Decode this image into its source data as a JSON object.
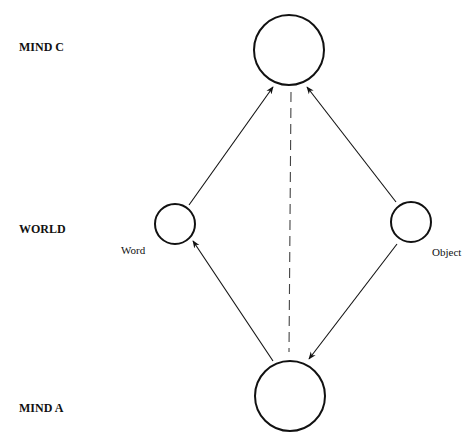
{
  "diagram": {
    "row_labels": {
      "mind_c": "MIND C",
      "world": "WORLD",
      "mind_a": "MIND A"
    },
    "node_labels": {
      "word": "Word",
      "object": "Object"
    },
    "nodes": [
      {
        "id": "mind_c",
        "cx": 289,
        "cy": 50,
        "r": 35
      },
      {
        "id": "word",
        "cx": 175,
        "cy": 224,
        "r": 20
      },
      {
        "id": "object",
        "cx": 411,
        "cy": 222,
        "r": 20
      },
      {
        "id": "mind_a",
        "cx": 290,
        "cy": 396,
        "r": 35
      }
    ],
    "edges": [
      {
        "from": "mind_a",
        "to": "word",
        "style": "solid-arrow"
      },
      {
        "from": "word",
        "to": "mind_c",
        "style": "solid-arrow"
      },
      {
        "from": "object",
        "to": "mind_c",
        "style": "solid-arrow"
      },
      {
        "from": "object",
        "to": "mind_a",
        "style": "solid-arrow"
      },
      {
        "from": "mind_c",
        "to": "mind_a",
        "style": "dashed"
      }
    ],
    "stroke_color": "#111111"
  }
}
